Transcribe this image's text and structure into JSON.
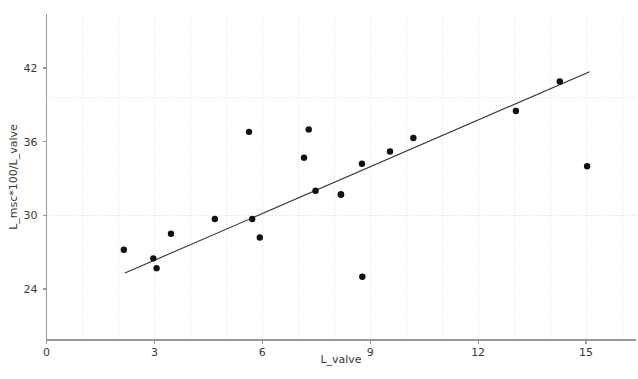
{
  "chart_data": {
    "type": "scatter",
    "title": "",
    "xlabel": "L_valve",
    "ylabel": "L_msc*100/L_valve",
    "xlim": [
      -0.4,
      16.4
    ],
    "ylim": [
      21.0,
      45.5
    ],
    "xticks": [
      0,
      3,
      6,
      9,
      12,
      15
    ],
    "yticks": [
      24,
      30,
      36,
      42
    ],
    "xtick_labels": [
      "0",
      "3",
      "6",
      "9",
      "12",
      "15"
    ],
    "ytick_labels": [
      "24",
      "30",
      "36",
      "42"
    ],
    "grid": "minor dotted vertical every 1 unit; dotted horizontal at 30 and 39.6",
    "hgrid_values": [
      30,
      39.6
    ],
    "legend": null,
    "points": [
      {
        "x": 2.15,
        "y": 27.2
      },
      {
        "x": 2.97,
        "y": 26.5
      },
      {
        "x": 3.06,
        "y": 25.7
      },
      {
        "x": 3.46,
        "y": 28.5
      },
      {
        "x": 4.68,
        "y": 29.7
      },
      {
        "x": 5.63,
        "y": 36.8
      },
      {
        "x": 5.72,
        "y": 29.7
      },
      {
        "x": 5.93,
        "y": 28.2
      },
      {
        "x": 7.16,
        "y": 34.7
      },
      {
        "x": 7.29,
        "y": 37.0
      },
      {
        "x": 7.48,
        "y": 32.0
      },
      {
        "x": 8.19,
        "y": 31.7
      },
      {
        "x": 8.18,
        "y": 31.7
      },
      {
        "x": 8.77,
        "y": 34.2
      },
      {
        "x": 8.78,
        "y": 25.0
      },
      {
        "x": 9.55,
        "y": 35.2
      },
      {
        "x": 10.2,
        "y": 36.3
      },
      {
        "x": 13.05,
        "y": 38.5
      },
      {
        "x": 14.27,
        "y": 40.9
      },
      {
        "x": 15.03,
        "y": 34.0
      }
    ],
    "fit_line": {
      "type": "linear-regression",
      "x_start": 2.18,
      "y_start": 25.3,
      "x_end": 15.1,
      "y_end": 41.7
    }
  }
}
